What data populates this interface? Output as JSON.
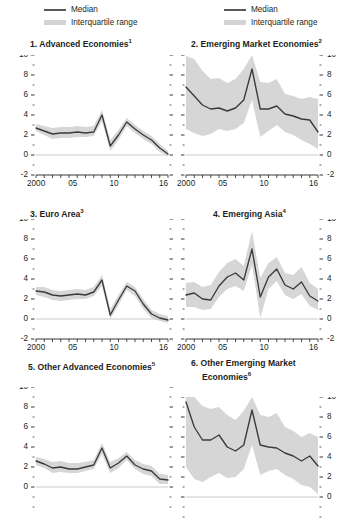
{
  "legend": {
    "left": {
      "median_label": "Median",
      "iqr_label": "Interquartile range"
    },
    "right": {
      "median_label": "Median",
      "iqr_label": "Interquartile range"
    }
  },
  "colors": {
    "median_line": "#58595b",
    "median_line_dark": "#3a3a3c",
    "iqr_band": "#d6d6d6",
    "iqr_band_light": "#e6e6e6",
    "axis": "#231f20",
    "zero_line": "#bcbcbc",
    "background": "#ffffff"
  },
  "chart_data": [
    {
      "type": "line",
      "panel": 1,
      "title": "1. Advanced Economies",
      "title_superscript": "1",
      "axis_side": "left",
      "xlabel": "",
      "ylabel": "",
      "xlim": [
        2000,
        2016
      ],
      "ylim": [
        -2,
        10
      ],
      "yticks": [
        -2,
        0,
        2,
        4,
        6,
        8,
        10
      ],
      "ytick_labels": [
        "-2",
        "0",
        "2",
        "4",
        "6",
        "8",
        "10"
      ],
      "xticks": [
        2000,
        2001,
        2002,
        2003,
        2004,
        2005,
        2006,
        2007,
        2008,
        2009,
        2010,
        2011,
        2012,
        2013,
        2014,
        2015,
        2016
      ],
      "xtick_labels_shown": {
        "2000": "2000",
        "2005": "05",
        "2010": "10",
        "2016": "16"
      },
      "grid": false,
      "zero_line": true,
      "x": [
        2000,
        2001,
        2002,
        2003,
        2004,
        2005,
        2006,
        2007,
        2008,
        2009,
        2010,
        2011,
        2012,
        2013,
        2014,
        2015,
        2016
      ],
      "series": [
        {
          "name": "Median",
          "values": [
            2.7,
            2.4,
            2.1,
            2.2,
            2.2,
            2.3,
            2.2,
            2.3,
            4.0,
            0.9,
            2.0,
            3.3,
            2.6,
            2.0,
            1.5,
            0.7,
            0.1
          ]
        }
      ],
      "band": {
        "name": "Interquartile range",
        "lower": [
          2.4,
          2.0,
          1.6,
          1.7,
          1.7,
          1.8,
          1.8,
          1.9,
          3.4,
          0.4,
          1.5,
          2.9,
          2.2,
          1.6,
          1.1,
          0.3,
          -0.1
        ],
        "upper": [
          3.1,
          2.9,
          2.7,
          2.8,
          2.8,
          2.9,
          2.8,
          2.9,
          4.5,
          1.5,
          2.5,
          3.7,
          3.0,
          2.4,
          1.9,
          1.1,
          0.4
        ]
      }
    },
    {
      "type": "line",
      "panel": 2,
      "title": "2. Emerging Market Economies",
      "title_superscript": "2",
      "axis_side": "right",
      "xlabel": "",
      "ylabel": "",
      "xlim": [
        2000,
        2016
      ],
      "ylim": [
        -2,
        10
      ],
      "yticks": [
        -2,
        0,
        2,
        4,
        6,
        8,
        10
      ],
      "ytick_labels": [
        "-2",
        "0",
        "2",
        "4",
        "6",
        "8",
        "10"
      ],
      "xticks": [
        2000,
        2001,
        2002,
        2003,
        2004,
        2005,
        2006,
        2007,
        2008,
        2009,
        2010,
        2011,
        2012,
        2013,
        2014,
        2015,
        2016
      ],
      "xtick_labels_shown": {
        "2000": "2000",
        "2005": "05",
        "2010": "10",
        "2016": "16"
      },
      "grid": false,
      "zero_line": true,
      "x": [
        2000,
        2001,
        2002,
        2003,
        2004,
        2005,
        2006,
        2007,
        2008,
        2009,
        2010,
        2011,
        2012,
        2013,
        2014,
        2015,
        2016
      ],
      "series": [
        {
          "name": "Median",
          "values": [
            6.8,
            5.9,
            5.0,
            4.6,
            4.7,
            4.4,
            4.7,
            5.5,
            8.6,
            4.6,
            4.6,
            4.9,
            4.1,
            3.9,
            3.6,
            3.5,
            2.3
          ]
        }
      ],
      "band": {
        "name": "Interquartile range",
        "lower": [
          2.6,
          2.2,
          1.9,
          2.1,
          2.6,
          2.4,
          2.6,
          3.2,
          5.5,
          1.8,
          2.4,
          3.0,
          2.3,
          2.0,
          1.5,
          1.1,
          0.6
        ],
        "upper": [
          9.9,
          9.6,
          8.4,
          7.6,
          7.7,
          7.2,
          7.6,
          8.6,
          10.0,
          7.3,
          7.2,
          7.6,
          6.1,
          5.9,
          5.6,
          5.8,
          5.6
        ]
      }
    },
    {
      "type": "line",
      "panel": 3,
      "title": "3. Euro Area",
      "title_superscript": "3",
      "axis_side": "left",
      "xlabel": "",
      "ylabel": "",
      "xlim": [
        2000,
        2016
      ],
      "ylim": [
        -2,
        10
      ],
      "yticks": [
        -2,
        0,
        2,
        4,
        6,
        8,
        10
      ],
      "ytick_labels": [
        "-2",
        "0",
        "2",
        "4",
        "6",
        "8",
        "10"
      ],
      "xticks": [
        2000,
        2001,
        2002,
        2003,
        2004,
        2005,
        2006,
        2007,
        2008,
        2009,
        2010,
        2011,
        2012,
        2013,
        2014,
        2015,
        2016
      ],
      "xtick_labels_shown": {
        "2000": "2000",
        "2005": "05",
        "2010": "10",
        "2016": "16"
      },
      "grid": false,
      "zero_line": true,
      "x": [
        2000,
        2001,
        2002,
        2003,
        2004,
        2005,
        2006,
        2007,
        2008,
        2009,
        2010,
        2011,
        2012,
        2013,
        2014,
        2015,
        2016
      ],
      "series": [
        {
          "name": "Median",
          "values": [
            2.8,
            2.7,
            2.4,
            2.3,
            2.4,
            2.5,
            2.4,
            2.7,
            3.9,
            0.4,
            1.9,
            3.3,
            2.8,
            1.5,
            0.5,
            0.1,
            -0.1
          ]
        }
      ],
      "band": {
        "name": "Interquartile range",
        "lower": [
          2.4,
          2.2,
          1.9,
          1.8,
          1.9,
          2.0,
          2.0,
          2.3,
          3.3,
          0.0,
          1.4,
          2.9,
          2.3,
          1.0,
          0.1,
          -0.2,
          -0.4
        ],
        "upper": [
          3.2,
          3.2,
          2.9,
          2.8,
          2.9,
          3.0,
          2.9,
          3.2,
          4.4,
          1.0,
          2.4,
          3.7,
          3.2,
          2.0,
          0.9,
          0.5,
          0.3
        ]
      }
    },
    {
      "type": "line",
      "panel": 4,
      "title": "4. Emerging Asia",
      "title_superscript": "4",
      "axis_side": "right",
      "xlabel": "",
      "ylabel": "",
      "xlim": [
        2000,
        2016
      ],
      "ylim": [
        -2,
        10
      ],
      "yticks": [
        -2,
        0,
        2,
        4,
        6,
        8,
        10
      ],
      "ytick_labels": [
        "-2",
        "0",
        "2",
        "4",
        "6",
        "8",
        "10"
      ],
      "xticks": [
        2000,
        2001,
        2002,
        2003,
        2004,
        2005,
        2006,
        2007,
        2008,
        2009,
        2010,
        2011,
        2012,
        2013,
        2014,
        2015,
        2016
      ],
      "xtick_labels_shown": {
        "2000": "2000",
        "2005": "05",
        "2010": "10",
        "2016": "16"
      },
      "grid": false,
      "zero_line": true,
      "x": [
        2000,
        2001,
        2002,
        2003,
        2004,
        2005,
        2006,
        2007,
        2008,
        2009,
        2010,
        2011,
        2012,
        2013,
        2014,
        2015,
        2016
      ],
      "series": [
        {
          "name": "Median",
          "values": [
            2.4,
            2.6,
            2.0,
            1.9,
            3.3,
            4.2,
            4.6,
            3.9,
            7.0,
            2.2,
            4.2,
            5.0,
            3.4,
            3.0,
            3.7,
            2.3,
            1.8
          ]
        }
      ],
      "band": {
        "name": "Interquartile range",
        "lower": [
          1.2,
          1.2,
          0.9,
          1.0,
          2.2,
          3.0,
          3.3,
          2.8,
          5.4,
          0.1,
          3.0,
          3.8,
          2.4,
          2.0,
          2.5,
          1.3,
          0.9
        ],
        "upper": [
          3.6,
          3.7,
          3.2,
          3.4,
          4.7,
          5.6,
          6.0,
          5.3,
          8.8,
          4.1,
          5.6,
          6.2,
          4.6,
          4.4,
          5.2,
          3.6,
          3.0
        ]
      }
    },
    {
      "type": "line",
      "panel": 5,
      "title": "5. Other Advanced Economies",
      "title_superscript": "5",
      "axis_side": "left",
      "xlabel": "",
      "ylabel": "",
      "xlim": [
        2000,
        2016
      ],
      "ylim": [
        -2,
        10
      ],
      "yticks": [
        0,
        2,
        4,
        6,
        8,
        10
      ],
      "ytick_labels": [
        "0",
        "2",
        "4",
        "6",
        "8",
        "10"
      ],
      "xticks": [
        2000,
        2001,
        2002,
        2003,
        2004,
        2005,
        2006,
        2007,
        2008,
        2009,
        2010,
        2011,
        2012,
        2013,
        2014,
        2015,
        2016
      ],
      "xtick_labels_shown": {},
      "grid": false,
      "zero_line": true,
      "cropped_bottom": true,
      "x": [
        2000,
        2001,
        2002,
        2003,
        2004,
        2005,
        2006,
        2007,
        2008,
        2009,
        2010,
        2011,
        2012,
        2013,
        2014,
        2015,
        2016
      ],
      "series": [
        {
          "name": "Median",
          "values": [
            2.6,
            2.3,
            1.9,
            2.0,
            1.8,
            1.8,
            2.0,
            2.2,
            3.9,
            1.9,
            2.4,
            3.1,
            2.2,
            1.8,
            1.6,
            0.8,
            0.7
          ]
        }
      ],
      "band": {
        "name": "Interquartile range",
        "lower": [
          2.2,
          1.9,
          1.4,
          1.5,
          1.4,
          1.4,
          1.6,
          1.8,
          3.3,
          1.4,
          1.9,
          2.7,
          1.8,
          1.3,
          1.1,
          0.3,
          0.3
        ],
        "upper": [
          3.0,
          2.8,
          2.5,
          2.6,
          2.4,
          2.4,
          2.5,
          2.7,
          4.4,
          2.5,
          2.9,
          3.5,
          2.7,
          2.3,
          2.1,
          1.3,
          1.2
        ]
      }
    },
    {
      "type": "line",
      "panel": 6,
      "title": "6. Other Emerging Market",
      "title_line2": "Economies",
      "title_superscript": "6",
      "axis_side": "right",
      "xlabel": "",
      "ylabel": "",
      "xlim": [
        2000,
        2016
      ],
      "ylim": [
        -2,
        10
      ],
      "yticks": [
        0,
        2,
        4,
        6,
        8,
        10
      ],
      "ytick_labels": [
        "0",
        "2",
        "4",
        "6",
        "8",
        "10"
      ],
      "xticks": [
        2000,
        2001,
        2002,
        2003,
        2004,
        2005,
        2006,
        2007,
        2008,
        2009,
        2010,
        2011,
        2012,
        2013,
        2014,
        2015,
        2016
      ],
      "xtick_labels_shown": {},
      "grid": false,
      "zero_line": true,
      "cropped_bottom": true,
      "x": [
        2000,
        2001,
        2002,
        2003,
        2004,
        2005,
        2006,
        2007,
        2008,
        2009,
        2010,
        2011,
        2012,
        2013,
        2014,
        2015,
        2016
      ],
      "series": [
        {
          "name": "Median",
          "values": [
            9.5,
            7.0,
            5.7,
            5.7,
            6.2,
            5.0,
            4.6,
            5.2,
            8.7,
            5.2,
            5.0,
            4.9,
            4.4,
            4.1,
            3.6,
            4.1,
            3.1
          ]
        }
      ],
      "band": {
        "name": "Interquartile range",
        "lower": [
          3.0,
          1.8,
          1.5,
          2.0,
          2.4,
          1.9,
          2.0,
          2.8,
          5.2,
          2.2,
          2.6,
          2.8,
          2.2,
          1.8,
          1.2,
          1.0,
          0.3
        ],
        "upper": [
          10.0,
          10.0,
          9.1,
          8.8,
          9.0,
          8.2,
          7.7,
          8.6,
          10.0,
          8.2,
          8.0,
          8.4,
          7.0,
          6.6,
          6.0,
          6.4,
          6.0
        ]
      }
    }
  ]
}
